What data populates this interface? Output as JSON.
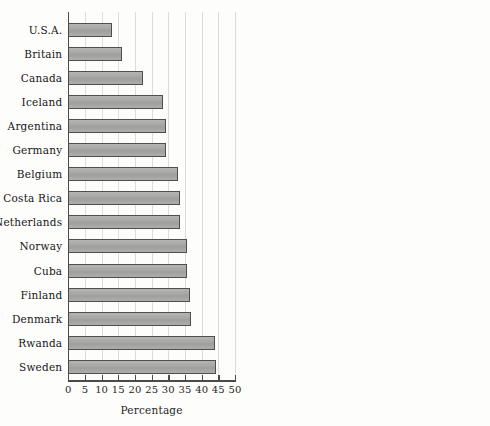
{
  "chart_data": {
    "type": "bar",
    "orientation": "horizontal",
    "title": "",
    "xlabel": "Percentage",
    "ylabel": "",
    "xlim": [
      0,
      50
    ],
    "xticks": [
      0,
      5,
      10,
      15,
      20,
      25,
      30,
      35,
      40,
      45,
      50
    ],
    "xtick_labels": [
      "0",
      "5",
      "10",
      "15",
      "20",
      "25",
      "30",
      "35",
      "40",
      "45",
      "50"
    ],
    "grid": true,
    "grid_axis": "x",
    "legend": false,
    "legend_position": "none",
    "bar_color": "#a9a9a7",
    "bar_edge_color": "#4f4f4f",
    "axis_color": "#4a4a4a",
    "gridline_color": "#dcdcda",
    "background_color": "#fdfdfc",
    "categories": [
      "U.S.A.",
      "Britain",
      "Canada",
      "Iceland",
      "Argentina",
      "Germany",
      "Belgium",
      "Costa Rica",
      "Netherlands",
      "Norway",
      "Cuba",
      "Finland",
      "Denmark",
      "Rwanda",
      "Sweden"
    ],
    "values": [
      13.2,
      16.0,
      22.4,
      28.4,
      29.3,
      29.3,
      33.0,
      33.4,
      33.4,
      35.6,
      35.6,
      36.5,
      36.8,
      43.9,
      44.2
    ]
  }
}
